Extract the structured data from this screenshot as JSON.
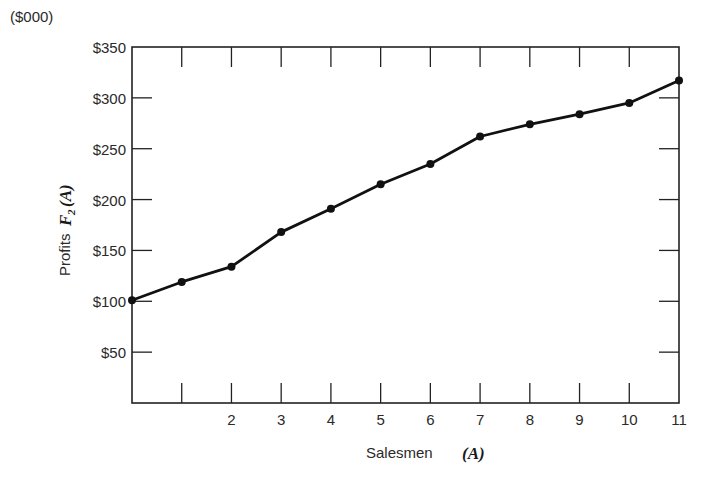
{
  "chart_data": {
    "type": "line",
    "title": "",
    "unit_label": "($000)",
    "xlabel": "Salesmen",
    "xlabel_var": "(A)",
    "ylabel": "Profits",
    "ylabel_var": "F",
    "ylabel_sub": "2",
    "ylabel_arg": "(A)",
    "x": [
      0,
      1,
      2,
      3,
      4,
      5,
      6,
      7,
      8,
      9,
      10,
      11
    ],
    "values": [
      101,
      119,
      134,
      168,
      191,
      215,
      235,
      262,
      274,
      284,
      295,
      317
    ],
    "xlim": [
      0,
      11
    ],
    "ylim": [
      0,
      350
    ],
    "x_ticks": [
      1,
      2,
      3,
      4,
      5,
      6,
      7,
      8,
      9,
      10,
      11
    ],
    "x_tick_labels": [
      "",
      "2",
      "3",
      "4",
      "5",
      "6",
      "7",
      "8",
      "9",
      "10",
      "11"
    ],
    "y_ticks": [
      50,
      100,
      150,
      200,
      250,
      300,
      350
    ],
    "y_tick_labels": [
      "$50",
      "$100",
      "$150",
      "$200",
      "$250",
      "$300",
      "$350"
    ],
    "grid": false,
    "legend": null,
    "line_color": "#111111",
    "frame": "box with inward ticks on all four sides"
  }
}
